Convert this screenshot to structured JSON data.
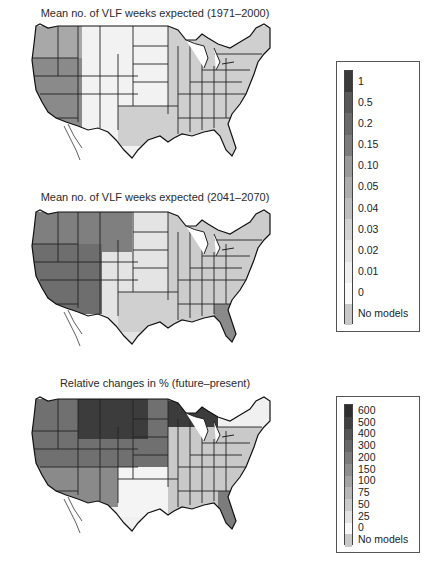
{
  "chart_data": [
    {
      "type": "heatmap",
      "title": "Mean no. of VLF weeks expected (1971–2000)",
      "subtitle": "",
      "xlabel": "",
      "ylabel": "",
      "region": "Contiguous United States (state boundaries)",
      "colorbar": {
        "ticks": [
          "1",
          "0.5",
          "0.2",
          "0.15",
          "0.10",
          "0.05",
          "0.04",
          "0.03",
          "0.02",
          "0.01",
          "0",
          "No models"
        ],
        "colors": [
          "#3a3a3a",
          "#585858",
          "#6a6a6a",
          "#7c7c7c",
          "#9a9a9a",
          "#adadad",
          "#bdbdbd",
          "#d2d2d2",
          "#e2e2e2",
          "#efefef",
          "#fafafa",
          "#c8c8c8"
        ]
      },
      "description": "Darkest values concentrated in Nevada, eastern California, southern Oregon and Idaho; most of the rest of the country near 0 or light grey.",
      "grid": false
    },
    {
      "type": "heatmap",
      "title": "Mean no. of VLF weeks expected (2041–2070)",
      "xlabel": "",
      "ylabel": "",
      "region": "Contiguous United States (state boundaries)",
      "colorbar": "shared with panel 1",
      "description": "Darker values expand across the northwest, Great Basin, Montana and northern Rockies; Gulf coast and Florida show moderate increases.",
      "grid": false
    },
    {
      "type": "heatmap",
      "title": "Relative changes in % (future–present)",
      "xlabel": "",
      "ylabel": "",
      "region": "Contiguous United States (state boundaries)",
      "colorbar": {
        "ticks": [
          "600",
          "500",
          "400",
          "300",
          "200",
          "150",
          "100",
          "75",
          "50",
          "25",
          "0",
          "No models"
        ],
        "colors": [
          "#2e2e2e",
          "#404040",
          "#555555",
          "#676767",
          "#7a7a7a",
          "#8e8e8e",
          "#a2a2a2",
          "#b6b6b6",
          "#cbcbcb",
          "#e2e2e2",
          "#f8f8f8",
          "#c8c8c8"
        ]
      },
      "description": "Largest relative increases (500–600%) over Montana, Wyoming, northern plains and upper Michigan/Wisconsin; moderate increases across the west; near-zero change in Texas/Oklahoma.",
      "grid": false
    }
  ],
  "panels": [
    {
      "title": "Mean no. of VLF weeks expected (1971–2000)"
    },
    {
      "title": "Mean no. of VLF weeks expected (2041–2070)"
    },
    {
      "title": "Relative changes in % (future–present)"
    }
  ],
  "legend1": {
    "labels": [
      "1",
      "0.5",
      "0.2",
      "0.15",
      "0.10",
      "0.05",
      "0.04",
      "0.03",
      "0.02",
      "0.01",
      "0",
      "No models"
    ],
    "colors": [
      "#3a3a3a",
      "#585858",
      "#6a6a6a",
      "#7c7c7c",
      "#9a9a9a",
      "#adadad",
      "#bdbdbd",
      "#d2d2d2",
      "#e2e2e2",
      "#efefef",
      "#fafafa",
      "#c8c8c8"
    ]
  },
  "legend2": {
    "labels": [
      "600",
      "500",
      "400",
      "300",
      "200",
      "150",
      "100",
      "75",
      "50",
      "25",
      "0",
      "No models"
    ],
    "colors": [
      "#2e2e2e",
      "#404040",
      "#555555",
      "#676767",
      "#7a7a7a",
      "#8e8e8e",
      "#a2a2a2",
      "#b6b6b6",
      "#cbcbcb",
      "#e2e2e2",
      "#f8f8f8",
      "#c8c8c8"
    ]
  },
  "map_fill": {
    "p1": {
      "west": "#8a8a8a",
      "northwest": "#a8a8a8",
      "interior": "#f2f2f2",
      "east": "#cfcfcf"
    },
    "p2": {
      "west": "#6e6e6e",
      "northwest": "#7f7f7f",
      "interior": "#e4e4e4",
      "east": "#cccccc"
    },
    "p3": {
      "west": "#707070",
      "north": "#3c3c3c",
      "interior": "#f0f0f0",
      "east": "#c9c9c9"
    }
  }
}
